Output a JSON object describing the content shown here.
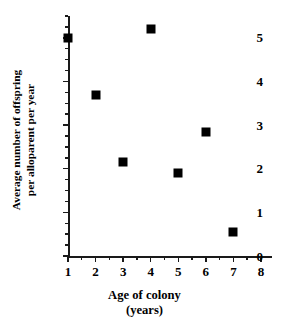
{
  "chart_data": {
    "type": "scatter",
    "title": "",
    "xlabel": "Age of colony",
    "xlabel_line2": "(years)",
    "ylabel": "Average number of offspring",
    "ylabel_line2": "per alloparent per year",
    "x": [
      1,
      2,
      3,
      4,
      5,
      6,
      7
    ],
    "values": [
      5.0,
      3.7,
      2.15,
      5.2,
      1.9,
      2.85,
      0.55
    ],
    "points": [
      {
        "x": 1,
        "y": 5.0
      },
      {
        "x": 2,
        "y": 3.7
      },
      {
        "x": 3,
        "y": 2.15
      },
      {
        "x": 4,
        "y": 5.2
      },
      {
        "x": 5,
        "y": 1.9
      },
      {
        "x": 6,
        "y": 2.85
      },
      {
        "x": 7,
        "y": 0.55
      }
    ],
    "xlim": [
      1,
      8.4
    ],
    "ylim": [
      0,
      5.5
    ],
    "xticks": [
      1,
      2,
      3,
      4,
      5,
      6,
      7,
      8
    ],
    "yticks": [
      0,
      1,
      2,
      3,
      4,
      5
    ],
    "xtick_labels": [
      "1",
      "2",
      "3",
      "4",
      "5",
      "6",
      "7",
      "8"
    ],
    "ytick_labels": [
      "0",
      "1",
      "2",
      "3",
      "4",
      "5"
    ],
    "x_minor_ticks": [
      1.5,
      2.5,
      3.5,
      4.5,
      5.5,
      6.5,
      7.5,
      8.5
    ],
    "y_minor_ticks": [
      0.25,
      0.5,
      0.75,
      1.25,
      1.5,
      1.75,
      2.25,
      2.5,
      2.75,
      3.25,
      3.5,
      3.75,
      4.25,
      4.5,
      4.75,
      5.25,
      5.5
    ],
    "grid": false,
    "legend": false,
    "marker": "square",
    "marker_color": "#000000",
    "axis_color": "#1a1a1a",
    "background": "#ffffff"
  }
}
